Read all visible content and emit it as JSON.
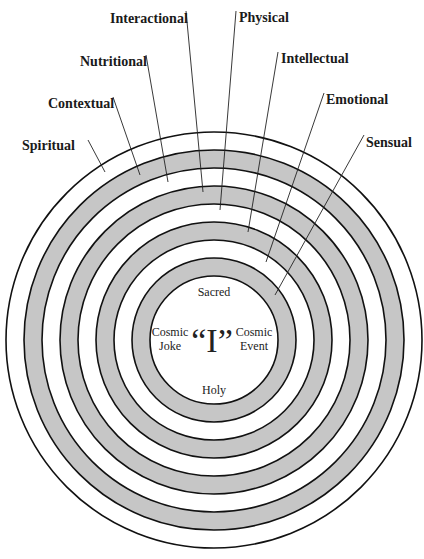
{
  "diagram": {
    "center": {
      "x": 214,
      "y": 340
    },
    "ring_radii": [
      208,
      190,
      172,
      154,
      136,
      118,
      100,
      82,
      64
    ],
    "band_fills": [
      "#ffffff",
      "#c6c6c6",
      "#ffffff",
      "#c6c6c6",
      "#ffffff",
      "#c6c6c6",
      "#ffffff",
      "#c6c6c6",
      "#ffffff"
    ],
    "colors": {
      "gray_band": "#c6c6c6",
      "stroke": "#111111",
      "background": "#ffffff"
    },
    "labels": [
      {
        "text": "Spiritual",
        "x": 22,
        "y": 150,
        "line": [
          88,
          140,
          105,
          172
        ]
      },
      {
        "text": "Contextual",
        "x": 48,
        "y": 108,
        "line": [
          113,
          97,
          140,
          175
        ]
      },
      {
        "text": "Nutritional",
        "x": 80,
        "y": 66,
        "line": [
          146,
          55,
          168,
          182
        ]
      },
      {
        "text": "Interactional",
        "x": 110,
        "y": 23,
        "line": [
          186,
          11,
          203,
          192
        ]
      },
      {
        "text": "Physical",
        "x": 239,
        "y": 22,
        "line": [
          236,
          11,
          220,
          210
        ]
      },
      {
        "text": "Intellectual",
        "x": 281,
        "y": 63,
        "line": [
          278,
          52,
          248,
          232
        ]
      },
      {
        "text": "Emotional",
        "x": 326,
        "y": 104,
        "line": [
          324,
          93,
          266,
          262
        ]
      },
      {
        "text": "Sensual",
        "x": 366,
        "y": 147,
        "line": [
          364,
          135,
          275,
          295
        ]
      }
    ],
    "center_text": {
      "top": "Sacred",
      "bottom": "Holy",
      "left_line1": "Cosmic",
      "left_line2": "Joke",
      "right_line1": "Cosmic",
      "right_line2": "Event",
      "core": "“I”"
    }
  }
}
